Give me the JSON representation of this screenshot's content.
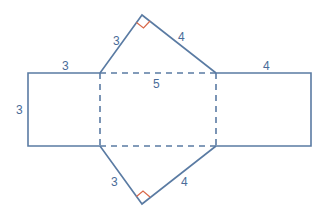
{
  "diagram": {
    "colors": {
      "line": "#5a7ba3",
      "right_angle": "#d9694a",
      "label": "#4a6c99"
    },
    "labels": {
      "top_left_leg": "3",
      "top_right_leg": "4",
      "left_rect_top": "3",
      "left_rect_side": "3",
      "middle_hypotenuse": "5",
      "right_rect_top": "4",
      "bottom_left_leg": "3",
      "bottom_right_leg": "4"
    }
  }
}
